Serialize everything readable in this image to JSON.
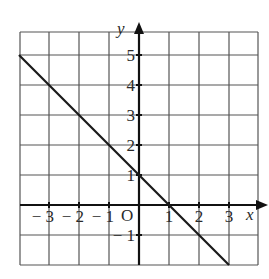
{
  "chart_data": {
    "type": "line",
    "title": "",
    "xlabel": "x",
    "ylabel": "y",
    "origin_label": "O",
    "xlim": [
      -4,
      4
    ],
    "ylim": [
      -2,
      6
    ],
    "grid": true,
    "x_ticks": [
      -3,
      -2,
      -1,
      1,
      2,
      3
    ],
    "y_ticks": [
      -1,
      1,
      2,
      3,
      4,
      5
    ],
    "x_tick_labels": [
      "− 3",
      "− 2",
      "− 1",
      "1",
      "2",
      "3"
    ],
    "y_tick_labels": [
      "− 1",
      "1",
      "2",
      "3",
      "4",
      "5"
    ],
    "series": [
      {
        "name": "y = 1 - x",
        "x": [
          -4,
          -3,
          -2,
          -1,
          0,
          1,
          2,
          3
        ],
        "y": [
          5,
          4,
          3,
          2,
          1,
          0,
          -1,
          -2
        ],
        "color": "#1a1a1a"
      }
    ]
  },
  "colors": {
    "grid": "#555555",
    "axis": "#111111",
    "line": "#1a1a1a",
    "background": "#ffffff"
  }
}
